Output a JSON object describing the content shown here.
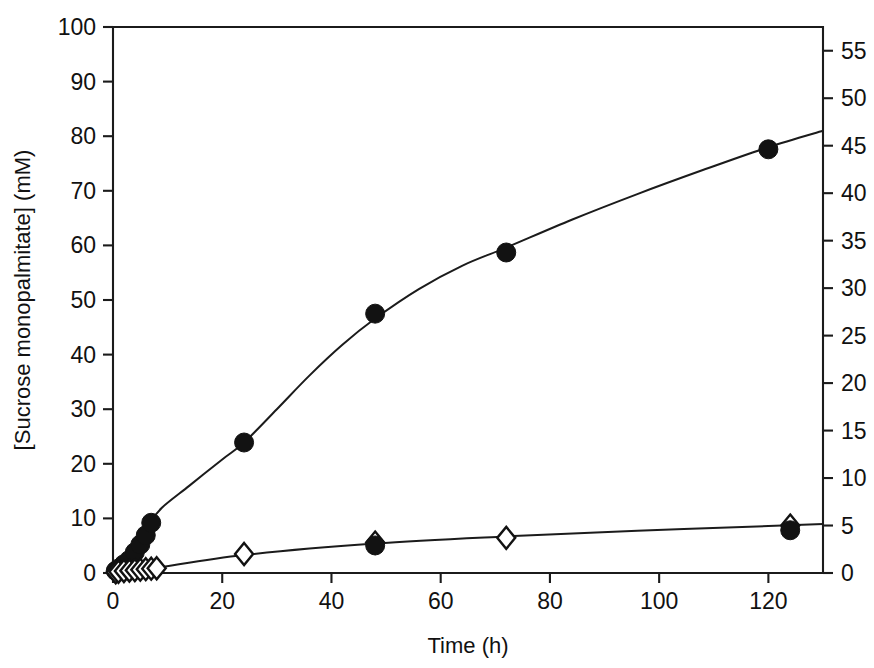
{
  "chart_data": {
    "type": "scatter",
    "title": "",
    "xlabel": "Time (h)",
    "ylabel": "[Sucrose monopalmitate] (mM)",
    "ylabel_right": "",
    "xlim": [
      0,
      130
    ],
    "ylim": [
      0,
      100
    ],
    "ylim_right": [
      0,
      57.5
    ],
    "xticks": [
      0,
      20,
      40,
      60,
      80,
      100,
      120
    ],
    "xtick_labels": [
      "0",
      "20",
      "40",
      "60",
      "80",
      "100",
      "120"
    ],
    "yticks": [
      0,
      10,
      20,
      30,
      40,
      50,
      60,
      70,
      80,
      90,
      100
    ],
    "ytick_labels": [
      "0",
      "10",
      "20",
      "30",
      "40",
      "50",
      "60",
      "70",
      "80",
      "90",
      "100"
    ],
    "yticks_right": [
      0,
      5,
      10,
      15,
      20,
      25,
      30,
      35,
      40,
      45,
      50,
      55
    ],
    "ytick_labels_right": [
      "0",
      "5",
      "10",
      "15",
      "20",
      "25",
      "30",
      "35",
      "40",
      "45",
      "50",
      "55"
    ],
    "grid": false,
    "legend": false,
    "legend_position": "none",
    "series": [
      {
        "name": "Sucrose monopalmitate",
        "marker": "filled-circle",
        "axis": "left",
        "x": [
          0.5,
          1,
          2,
          3,
          4,
          5,
          6,
          7,
          24,
          48,
          72,
          120
        ],
        "y": [
          0.4,
          0.8,
          1.6,
          2.4,
          3.8,
          5.2,
          6.9,
          9.2,
          23.9,
          47.5,
          58.7,
          77.6
        ]
      },
      {
        "name": "Second product",
        "marker": "open-diamond",
        "axis": "right",
        "x": [
          0.5,
          1,
          2,
          3,
          4,
          5,
          6,
          7,
          8,
          24,
          48,
          72,
          124
        ],
        "y": [
          0.08,
          0.12,
          0.2,
          0.25,
          0.3,
          0.35,
          0.4,
          0.45,
          0.5,
          2.0,
          3.2,
          3.7,
          5.0
        ]
      },
      {
        "name": "Second product overlap",
        "marker": "filled-circle",
        "axis": "right",
        "x": [
          48,
          124
        ],
        "y": [
          2.9,
          4.5
        ]
      }
    ],
    "fit_curves": [
      {
        "name": "left-axis fit",
        "axis": "left",
        "points": [
          [
            2.0,
            0.5
          ],
          [
            4.0,
            3.0
          ],
          [
            6.0,
            6.4
          ],
          [
            7.0,
            9.4
          ],
          [
            9.0,
            12.0
          ],
          [
            14.0,
            16.0
          ],
          [
            20.0,
            20.8
          ],
          [
            24.0,
            23.9
          ],
          [
            30.0,
            30.0
          ],
          [
            36.0,
            36.2
          ],
          [
            42.0,
            41.8
          ],
          [
            48.0,
            46.6
          ],
          [
            56.0,
            52.0
          ],
          [
            64.0,
            56.3
          ],
          [
            72.0,
            59.6
          ],
          [
            84.0,
            64.7
          ],
          [
            96.0,
            69.4
          ],
          [
            108.0,
            73.8
          ],
          [
            120.0,
            78.0
          ],
          [
            130.0,
            81.0
          ]
        ]
      },
      {
        "name": "right-axis fit",
        "axis": "right",
        "points": [
          [
            2.0,
            0.1
          ],
          [
            8.0,
            0.55
          ],
          [
            24.0,
            1.9
          ],
          [
            48.0,
            3.1
          ],
          [
            72.0,
            3.85
          ],
          [
            96.0,
            4.45
          ],
          [
            120.0,
            4.95
          ],
          [
            130.0,
            5.15
          ]
        ]
      }
    ]
  },
  "geometry": {
    "plot_left": 113,
    "plot_right": 823,
    "plot_top": 27,
    "plot_bottom": 573
  }
}
